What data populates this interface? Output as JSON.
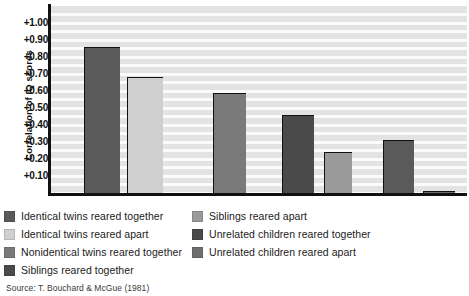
{
  "chart_data": {
    "type": "bar",
    "title": "",
    "xlabel": "",
    "ylabel": "Correlation of IQ scores",
    "ylim": [
      0,
      1.05
    ],
    "grid": true,
    "legend_position": "below",
    "source": "Source: T. Bouchard & McGue (1981)",
    "ytick_labels": [
      "+1.00",
      "+0.90",
      "+0.80",
      "+0.70",
      "+0.60",
      "+0.50",
      "+0.40",
      "+0.30",
      "+0.20",
      "+0.10"
    ],
    "ytick_values": [
      1.0,
      0.9,
      0.8,
      0.7,
      0.6,
      0.5,
      0.4,
      0.3,
      0.2,
      0.1
    ],
    "categories": [
      "Identical twins reared together",
      "Identical twins reared apart",
      "Nonidentical twins reared together",
      "Siblings reared together",
      "Siblings reared apart",
      "Unrelated children reared together",
      "Unrelated children reared apart"
    ],
    "values": [
      0.86,
      0.68,
      0.59,
      0.46,
      0.24,
      0.31,
      0.01
    ],
    "colors": [
      "#5a5a5a",
      "#cfcfcf",
      "#7a7a7a",
      "#4a4a4a",
      "#9a9a9a",
      "#5a5a5a",
      "#6e6e6e"
    ]
  },
  "legend": {
    "left_column": [
      {
        "label": "Identical twins reared together",
        "color": "#5a5a5a"
      },
      {
        "label": "Identical twins reared apart",
        "color": "#cfcfcf"
      },
      {
        "label": "Nonidentical twins reared together",
        "color": "#7a7a7a"
      },
      {
        "label": "Siblings reared together",
        "color": "#4a4a4a"
      }
    ],
    "right_column": [
      {
        "label": "Siblings reared apart",
        "color": "#9a9a9a"
      },
      {
        "label": "Unrelated children reared together",
        "color": "#4a4a4a"
      },
      {
        "label": "Unrelated children reared apart",
        "color": "#6e6e6e"
      }
    ]
  }
}
